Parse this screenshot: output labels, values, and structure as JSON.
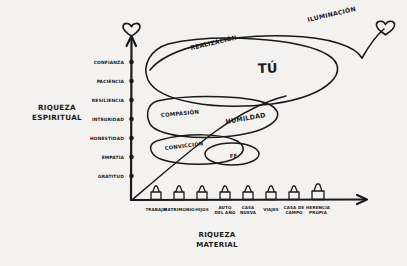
{
  "figure": {
    "kind": "hand-drawn-sketch-diagram",
    "background_color": "#f3f2f0",
    "ink_color": "#1a1a1a"
  },
  "axes": {
    "y": {
      "title_line1": "RIQUEZA",
      "title_line2": "ESPIRITUAL",
      "tick_labels": [
        "CONFIANZA",
        "PACIENCIA",
        "RESILIENCIA",
        "INTEGRIDAD",
        "HONESTIDAD",
        "EMPATÍA",
        "GRATITUD"
      ],
      "arrow_tip_icon": "heart-icon"
    },
    "x": {
      "title_line1": "RIQUEZA",
      "title_line2": "MATERIAL",
      "tick_labels": [
        {
          "line1": "TRABAJO",
          "line2": ""
        },
        {
          "line1": "MATRIMONIO",
          "line2": ""
        },
        {
          "line1": "HIJOS",
          "line2": ""
        },
        {
          "line1": "AUTO",
          "line2": "DEL AÑO"
        },
        {
          "line1": "CASA",
          "line2": "NUEVA"
        },
        {
          "line1": "VIAJES",
          "line2": ""
        },
        {
          "line1": "CASA DE",
          "line2": "CAMPO"
        },
        {
          "line1": "HERENCIA",
          "line2": "PROPIA"
        }
      ],
      "tick_icon": "house-icon"
    }
  },
  "loops": [
    {
      "id": "loop-top",
      "labels": [
        "REALIZACIÓN",
        "TÚ"
      ]
    },
    {
      "id": "loop-middle",
      "labels": [
        "COMPASIÓN",
        "HUMILDAD"
      ]
    },
    {
      "id": "loop-bottom",
      "labels": [
        "CONVICCIÓN",
        "FE"
      ]
    }
  ],
  "annotations": {
    "spiral_end_label": "ILUMINACIÓN",
    "spiral_end_icon": "heart-icon"
  },
  "labels": {
    "realizacion": "REALIZACIÓN",
    "tu": "TÚ",
    "compasion": "COMPASIÓN",
    "humildad": "HUMILDAD",
    "conviccion": "CONVICCIÓN",
    "fe": "FE",
    "iluminacion": "ILUMINACIÓN"
  }
}
